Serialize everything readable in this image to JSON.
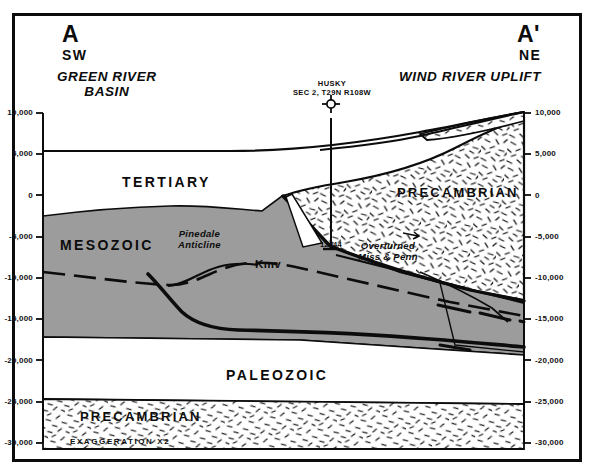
{
  "figure": {
    "type": "geologic-cross-section",
    "exaggeration_note": "EXAGGERATION X2"
  },
  "ends": {
    "left_label": "A",
    "left_direction": "SW",
    "left_region": "GREEN RIVER\nBASIN",
    "right_label": "A'",
    "right_direction": "NE",
    "right_region": "WIND RIVER UPLIFT"
  },
  "well": {
    "name": "HUSKY",
    "location": "SEC 2, T29N R108W",
    "total_depth": "12944",
    "symbol": "well-spud-icon"
  },
  "units": {
    "tertiary": "TERTIARY",
    "mesozoic": "MESOZOIC",
    "paleozoic": "PALEOZOIC",
    "precambrian_right": "PRECAMBRIAN",
    "precambrian_bottom": "PRECAMBRIAN"
  },
  "structures": {
    "anticline": "Pinedale\nAnticline",
    "marker_horizon": "Kmv",
    "overturned": "Overturned\nMiss & Penn"
  },
  "axis": {
    "label_unit": "feet",
    "ticks": [
      "10,000",
      "5,000",
      "0",
      "-5,000",
      "-10,000",
      "-15,000",
      "-20,000",
      "-25,000",
      "-30,000"
    ],
    "values": [
      10000,
      5000,
      0,
      -5000,
      -10000,
      -15000,
      -20000,
      -25000,
      -30000
    ],
    "min": -30000,
    "max": 10000,
    "step": 5000
  },
  "colors": {
    "ink": "#0c0c0c",
    "mesozoic_fill": "#9c9c9c",
    "precambrian_fill": "#ffffff",
    "background": "#ffffff"
  }
}
